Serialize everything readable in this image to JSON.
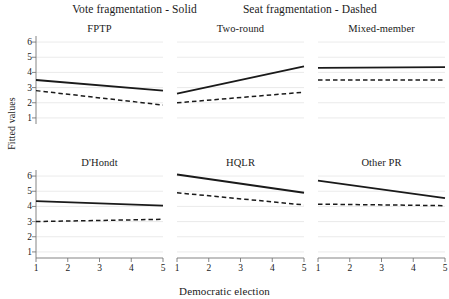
{
  "legend": {
    "vote": "Vote fragmentation - Solid",
    "seat": "Seat fragmentation - Dashed"
  },
  "axes": {
    "xlabel": "Democratic election",
    "ylabel": "Fitted values",
    "xticks": [
      "1",
      "2",
      "3",
      "4",
      "5"
    ],
    "yticks": [
      "1",
      "2",
      "3",
      "4",
      "5",
      "6"
    ]
  },
  "chart_data": {
    "type": "line",
    "title": "",
    "subtitle": "",
    "xlabel": "Democratic election",
    "ylabel": "Fitted values",
    "xlim": [
      1,
      5
    ],
    "ylim": [
      0.6,
      6.4
    ],
    "grid": true,
    "legend_position": "top",
    "x": [
      1,
      5
    ],
    "facet_layout": {
      "rows": 2,
      "cols": 3
    },
    "series_styles": [
      {
        "name": "Vote fragmentation",
        "style": "solid",
        "color": "#1a1a1a"
      },
      {
        "name": "Seat fragmentation",
        "style": "dashed",
        "color": "#1a1a1a"
      }
    ],
    "panels": [
      {
        "title": "FPTP",
        "series": [
          {
            "name": "Vote fragmentation",
            "style": "solid",
            "values": [
              3.5,
              2.8
            ]
          },
          {
            "name": "Seat fragmentation",
            "style": "dashed",
            "values": [
              2.8,
              1.85
            ]
          }
        ]
      },
      {
        "title": "Two-round",
        "series": [
          {
            "name": "Vote fragmentation",
            "style": "solid",
            "values": [
              2.6,
              4.4
            ]
          },
          {
            "name": "Seat fragmentation",
            "style": "dashed",
            "values": [
              2.0,
              2.7
            ]
          }
        ]
      },
      {
        "title": "Mixed-member",
        "series": [
          {
            "name": "Vote fragmentation",
            "style": "solid",
            "values": [
              4.3,
              4.35
            ]
          },
          {
            "name": "Seat fragmentation",
            "style": "dashed",
            "values": [
              3.5,
              3.5
            ]
          }
        ]
      },
      {
        "title": "D'Hondt",
        "series": [
          {
            "name": "Vote fragmentation",
            "style": "solid",
            "values": [
              4.35,
              4.05
            ]
          },
          {
            "name": "Seat fragmentation",
            "style": "dashed",
            "values": [
              3.0,
              3.15
            ]
          }
        ]
      },
      {
        "title": "HQLR",
        "series": [
          {
            "name": "Vote fragmentation",
            "style": "solid",
            "values": [
              6.1,
              4.9
            ]
          },
          {
            "name": "Seat fragmentation",
            "style": "dashed",
            "values": [
              4.9,
              4.1
            ]
          }
        ]
      },
      {
        "title": "Other PR",
        "series": [
          {
            "name": "Vote fragmentation",
            "style": "solid",
            "values": [
              5.7,
              4.55
            ]
          },
          {
            "name": "Seat fragmentation",
            "style": "dashed",
            "values": [
              4.15,
              4.05
            ]
          }
        ]
      }
    ]
  }
}
